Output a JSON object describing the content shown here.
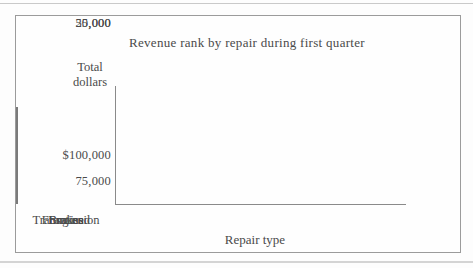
{
  "chart_data": {
    "type": "bar",
    "title": "Revenue rank by repair during first quarter",
    "xlabel": "Repair type",
    "ylabel": "Total dollars",
    "ylabel_lines": [
      "Total",
      "dollars"
    ],
    "categories": [
      "Transmission",
      "Engine",
      "Front end",
      "Brakes"
    ],
    "values": [
      95000,
      73000,
      58000,
      40000
    ],
    "ytick_labels": [
      "$100,000",
      "75,000",
      "50,000",
      "25,000"
    ],
    "ytick_values": [
      100000,
      75000,
      50000,
      25000
    ],
    "ylim": [
      0,
      110000
    ],
    "legend": "none",
    "grid": false,
    "bar_fill": "#ffffff",
    "bar_border": "#7a7a7a"
  },
  "colors": {
    "text": "#4a4a4a",
    "axis_line": "#8a8a8a",
    "frame_border": "#9b9b9b",
    "background": "#fdfdfd"
  }
}
